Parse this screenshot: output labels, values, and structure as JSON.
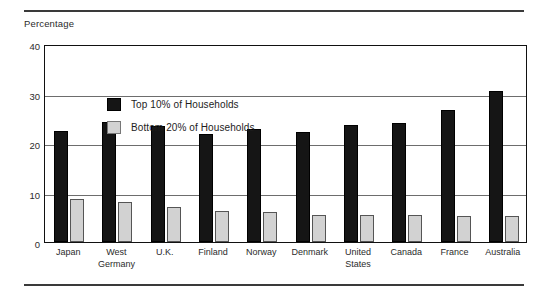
{
  "figure": {
    "axis_title": "Percentage"
  },
  "legend": {
    "position": "inside-top-left",
    "entries": [
      {
        "label": "Top 10% of Households",
        "swatch": "dark",
        "color": "#151515"
      },
      {
        "label": "Bottom 20% of Households",
        "swatch": "light",
        "color": "#d2d2d2"
      }
    ]
  },
  "chart_data": {
    "type": "bar",
    "title": "",
    "subtitle": "",
    "xlabel": "",
    "ylabel": "Percentage",
    "ylim": [
      0,
      40
    ],
    "yticks": [
      0,
      10,
      20,
      30,
      40
    ],
    "ytick_labels": [
      "0",
      "10",
      "20",
      "30",
      "40"
    ],
    "grid": true,
    "grid_axis": "y",
    "legend_position": "inside-top-left",
    "categories": [
      "Japan",
      "West\nGermany",
      "U.K.",
      "Finland",
      "Norway",
      "Denmark",
      "United\nStates",
      "Canada",
      "France",
      "Australia"
    ],
    "series": [
      {
        "name": "Top 10% of Households",
        "color": "#151515",
        "values": [
          22.4,
          24.2,
          23.4,
          21.8,
          22.8,
          22.2,
          23.6,
          24.1,
          26.6,
          30.5
        ]
      },
      {
        "name": "Bottom 20% of Households",
        "color": "#d2d2d2",
        "values": [
          8.7,
          8.1,
          7.1,
          6.3,
          6.0,
          5.4,
          5.4,
          5.4,
          5.3,
          5.3
        ]
      }
    ]
  }
}
